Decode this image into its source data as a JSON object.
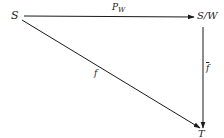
{
  "diagram": {
    "type": "commutative-diagram",
    "nodes": {
      "S": {
        "label": "S"
      },
      "SW": {
        "label": "S/W"
      },
      "T": {
        "label": "T"
      }
    },
    "edges": {
      "pw": {
        "from": "S",
        "to": "S/W",
        "label_main": "P",
        "label_sub": "W"
      },
      "f": {
        "from": "S",
        "to": "T",
        "label": "f"
      },
      "fbar": {
        "from": "S/W",
        "to": "T",
        "label": "f"
      }
    },
    "colors": {
      "line": "#1a1a1a",
      "text": "#222222",
      "background": "#ffffff"
    }
  }
}
